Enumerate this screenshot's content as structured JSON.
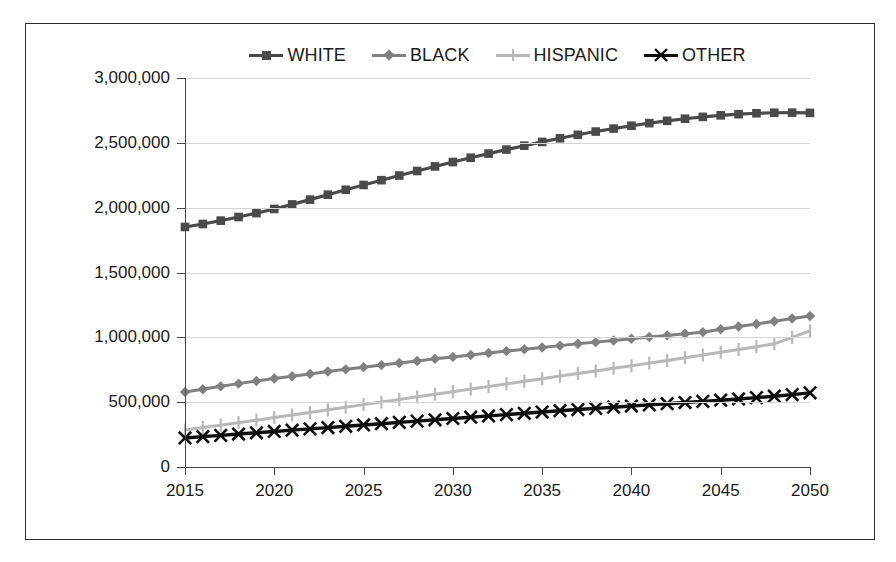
{
  "chart_data": {
    "type": "line",
    "title": "",
    "subtitle": "",
    "xlabel": "",
    "ylabel": "",
    "xlim": [
      2015,
      2050
    ],
    "ylim": [
      0,
      3000000
    ],
    "grid": true,
    "legend_position": "top",
    "x": [
      2015,
      2016,
      2017,
      2018,
      2019,
      2020,
      2021,
      2022,
      2023,
      2024,
      2025,
      2026,
      2027,
      2028,
      2029,
      2030,
      2031,
      2032,
      2033,
      2034,
      2035,
      2036,
      2037,
      2038,
      2039,
      2040,
      2041,
      2042,
      2043,
      2044,
      2045,
      2046,
      2047,
      2048,
      2049,
      2050
    ],
    "x_ticks": [
      "2015",
      "2020",
      "2025",
      "2030",
      "2035",
      "2040",
      "2045",
      "2050"
    ],
    "x_tick_values": [
      2015,
      2020,
      2025,
      2030,
      2035,
      2040,
      2045,
      2050
    ],
    "y_ticks": [
      "0",
      "500,000",
      "1,000,000",
      "1,500,000",
      "2,000,000",
      "2,500,000",
      "3,000,000"
    ],
    "y_tick_values": [
      0,
      500000,
      1000000,
      1500000,
      2000000,
      2500000,
      3000000
    ],
    "series": [
      {
        "name": "WHITE",
        "color": "#4a4a4a",
        "marker": "square",
        "values": [
          1851000,
          1874000,
          1900000,
          1928000,
          1958000,
          1990000,
          2025000,
          2062000,
          2100000,
          2138000,
          2175000,
          2212000,
          2248000,
          2283000,
          2318000,
          2352000,
          2385000,
          2417000,
          2448000,
          2478000,
          2507000,
          2535000,
          2562000,
          2587000,
          2610000,
          2632000,
          2652000,
          2670000,
          2686000,
          2700000,
          2712000,
          2721000,
          2728000,
          2732000,
          2733000,
          2731000
        ]
      },
      {
        "name": "BLACK",
        "color": "#808080",
        "marker": "diamond",
        "values": [
          578000,
          600000,
          622000,
          643000,
          663000,
          682000,
          700000,
          718000,
          736000,
          753000,
          770000,
          786000,
          802000,
          818000,
          834000,
          849000,
          864000,
          879000,
          894000,
          908000,
          922000,
          936000,
          950000,
          963000,
          976000,
          989000,
          1002000,
          1015000,
          1028000,
          1040000,
          1062000,
          1083000,
          1103000,
          1124000,
          1145000,
          1165000
        ]
      },
      {
        "name": "HISPANIC",
        "color": "#b8b8b8",
        "marker": "plus",
        "values": [
          285000,
          304000,
          323000,
          342000,
          361000,
          381000,
          401000,
          421000,
          441000,
          461000,
          481000,
          501000,
          521000,
          541000,
          561000,
          581000,
          601000,
          621000,
          641000,
          661000,
          681000,
          701000,
          721000,
          741000,
          761000,
          781000,
          801000,
          822000,
          843000,
          864000,
          885000,
          906000,
          928000,
          950000,
          1000000,
          1050000
        ]
      },
      {
        "name": "OTHER",
        "color": "#0d0d0d",
        "marker": "x",
        "values": [
          224000,
          234000,
          244000,
          254000,
          264000,
          274000,
          284000,
          294000,
          304000,
          314000,
          324000,
          334000,
          344000,
          354000,
          364000,
          374000,
          384000,
          394000,
          404000,
          414000,
          424000,
          434000,
          443000,
          452000,
          461000,
          470000,
          479000,
          488000,
          497000,
          506000,
          515000,
          525000,
          535000,
          546000,
          558000,
          572000
        ]
      }
    ]
  },
  "legend": {
    "items": [
      {
        "label": "WHITE"
      },
      {
        "label": "BLACK"
      },
      {
        "label": "HISPANIC"
      },
      {
        "label": "OTHER"
      }
    ]
  }
}
